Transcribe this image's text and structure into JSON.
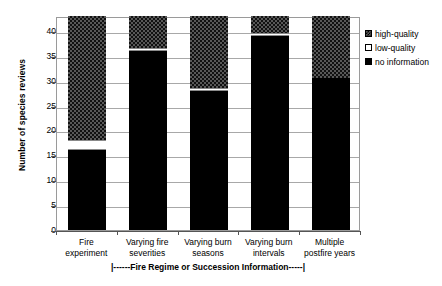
{
  "chart_data": {
    "type": "bar",
    "stacked": true,
    "title": "",
    "xlabel": "|------Fire Regime or Succession Information-----|",
    "ylabel": "Number of species reviews",
    "ylim": [
      0,
      43
    ],
    "yticks": [
      0,
      5,
      10,
      15,
      20,
      25,
      30,
      35,
      40
    ],
    "ytick_labels": [
      "0",
      "5",
      "10",
      "15",
      "20",
      "25",
      "30",
      "35",
      "40"
    ],
    "grid": true,
    "legend_position": "right",
    "categories": [
      "Fire experiment",
      "Varying fire severities",
      "Varying burn seasons",
      "Varying burn intervals",
      "Multiple postfire years"
    ],
    "category_lines": [
      [
        "Fire",
        "experiment"
      ],
      [
        "Varying fire",
        "severities"
      ],
      [
        "Varying burn",
        "seasons"
      ],
      [
        "Varying burn",
        "intervals"
      ],
      [
        "Multiple",
        "postfire years"
      ]
    ],
    "series": [
      {
        "name": "no information",
        "color": "#000000",
        "pattern": "solid-black",
        "values": [
          16,
          36,
          28,
          39,
          30.5
        ]
      },
      {
        "name": "low-quality",
        "color": "#ffffff",
        "pattern": "empty-white",
        "values": [
          2,
          0.5,
          0.5,
          0.5,
          0
        ]
      },
      {
        "name": "high-quality",
        "color": "#585858",
        "pattern": "checkerboard",
        "values": [
          25,
          6.5,
          14.5,
          3.5,
          12.5
        ]
      }
    ],
    "series_order_bottom_to_top": [
      "no information",
      "low-quality",
      "high-quality"
    ],
    "stack_totals": [
      43,
      43,
      43,
      43,
      43
    ]
  },
  "legend": {
    "entries": [
      {
        "label": "high-quality",
        "key": "high-quality"
      },
      {
        "label": "low-quality",
        "key": "low-quality"
      },
      {
        "label": "no information",
        "key": "no-information"
      }
    ]
  },
  "axes": {
    "y_title": "Number of species reviews",
    "x_bracket": "|------Fire Regime or Succession Information-----|"
  }
}
